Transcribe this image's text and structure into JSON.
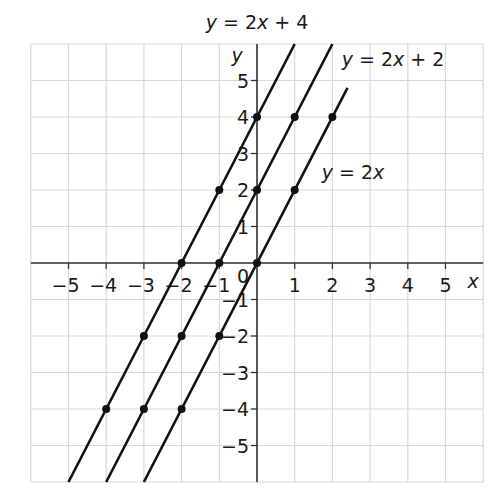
{
  "chart_data": {
    "type": "line",
    "title": "",
    "xlabel": "x",
    "ylabel": "y",
    "xlim": [
      -6,
      6
    ],
    "ylim": [
      -6,
      6
    ],
    "grid": true,
    "origin_label": "0",
    "x_ticks": [
      -5,
      -4,
      -3,
      -2,
      -1,
      1,
      2,
      3,
      4,
      5
    ],
    "x_tick_labels": [
      "−5",
      "−4",
      "−3",
      "−2",
      "−1",
      "1",
      "2",
      "3",
      "4",
      "5"
    ],
    "y_ticks": [
      5,
      4,
      3,
      2,
      1,
      -1,
      -2,
      -3,
      -4,
      -5
    ],
    "y_tick_labels": [
      "5",
      "4",
      "3",
      "2",
      "1",
      "−1",
      "−2",
      "−3",
      "−4",
      "−5"
    ],
    "series": [
      {
        "name": "y = 2x + 4",
        "slope": 2,
        "intercept": 4,
        "points": [
          [
            -4,
            -4
          ],
          [
            -3,
            -2
          ],
          [
            -2,
            0
          ],
          [
            -1,
            2
          ],
          [
            0,
            4
          ]
        ],
        "line_x_range": [
          -5,
          1
        ],
        "label": {
          "text": "y = 2x + 4",
          "x": 257,
          "y": 29
        }
      },
      {
        "name": "y = 2x + 2",
        "slope": 2,
        "intercept": 2,
        "points": [
          [
            -3,
            -4
          ],
          [
            -2,
            -2
          ],
          [
            -1,
            0
          ],
          [
            0,
            2
          ],
          [
            1,
            4
          ]
        ],
        "line_x_range": [
          -4,
          2
        ],
        "label": {
          "text": "y = 2x + 2",
          "x": 393,
          "y": 66
        }
      },
      {
        "name": "y = 2x",
        "slope": 2,
        "intercept": 0,
        "points": [
          [
            -2,
            -4
          ],
          [
            -1,
            -2
          ],
          [
            0,
            0
          ],
          [
            1,
            2
          ],
          [
            2,
            4
          ]
        ],
        "line_x_range": [
          -3,
          2.4
        ],
        "label": {
          "text": "y = 2x",
          "x": 353,
          "y": 179
        }
      }
    ],
    "colors": {
      "line": "#111111",
      "grid": "#d9d9d9",
      "axis": "#333333",
      "text": "#1a1a1a"
    }
  }
}
